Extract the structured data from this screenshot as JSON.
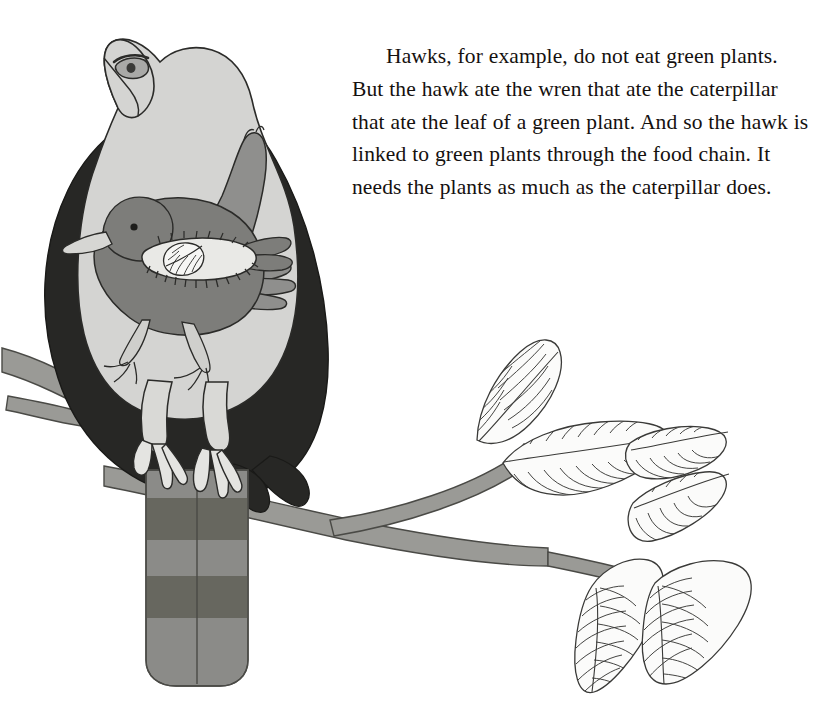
{
  "page": {
    "background_color": "#ffffff",
    "width": 825,
    "height": 724
  },
  "text_block": {
    "paragraph": "Hawks, for example, do not eat green plants. But the hawk ate the wren that ate the caterpillar that ate the leaf of a green plant. And so the hawk is linked to green plants through the food chain. It needs the plants as much as the caterpillar does.",
    "lines": [
      "Hawks, for example, do not eat green",
      "plants. But the hawk ate the wren that",
      "ate the caterpillar that ate the leaf of a",
      "green plant. And so the hawk is linked",
      "to green plants through the food chain. It",
      "needs the plants as much as the caterpillar",
      "does."
    ],
    "text_color": "#15110f"
  },
  "illustration": {
    "description": "Nested drawing: a hawk perched on a branch, with a wren drawn inside its body, a caterpillar inside the wren, and a leaf inside the caterpillar. A leafy twig extends to the right.",
    "colors": {
      "hawk_body": "#d4d4d2",
      "hawk_wing_dark": "#272725",
      "hawk_wing_gray": "#8f8f8d",
      "hawk_tail_light": "#8b8b88",
      "hawk_tail_band": "#67675f",
      "hawk_leg": "#d9d9d6",
      "wren_body": "#7d7d7a",
      "caterpillar_body": "#e9e9e6",
      "leaf_fill": "#fbfbfa",
      "branch": "#9a9a96",
      "outline": "#2b2b29"
    },
    "elements": [
      {
        "name": "hawk",
        "label": "hawk"
      },
      {
        "name": "wren",
        "label": "wren"
      },
      {
        "name": "caterpillar",
        "label": "caterpillar"
      },
      {
        "name": "leaf-inside-caterpillar",
        "label": "leaf"
      },
      {
        "name": "branch",
        "label": "branch"
      },
      {
        "name": "leafy-twig",
        "label": "leaves"
      }
    ]
  }
}
